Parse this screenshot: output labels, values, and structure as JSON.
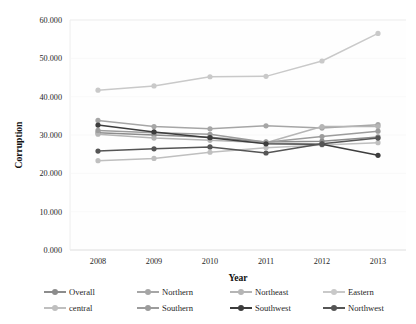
{
  "chart_data": {
    "type": "line",
    "title": "",
    "xlabel": "Year",
    "ylabel": "Corruption",
    "categories": [
      "2008",
      "2009",
      "2010",
      "2011",
      "2012",
      "2013"
    ],
    "x": [
      2008,
      2009,
      2010,
      2011,
      2012,
      2013
    ],
    "ylim": [
      0,
      60
    ],
    "ytick_labels": [
      "0.000",
      "10.000",
      "20.000",
      "30.000",
      "40.000",
      "50.000",
      "60.000"
    ],
    "ytick_values": [
      0,
      10,
      20,
      30,
      40,
      50,
      60
    ],
    "grid": false,
    "legend_position": "bottom",
    "series": [
      {
        "name": "Overall",
        "color": "#8c8c8c",
        "values": [
          30.6,
          30.0,
          29.4,
          28.2,
          28.4,
          29.5
        ]
      },
      {
        "name": "Northern",
        "color": "#a6a6a6",
        "values": [
          33.8,
          32.2,
          31.6,
          32.4,
          31.8,
          32.7
        ]
      },
      {
        "name": "Northeast",
        "color": "#b5b5b5",
        "values": [
          30.2,
          29.2,
          28.6,
          28.0,
          32.2,
          32.2
        ]
      },
      {
        "name": "Eastern",
        "color": "#c9c9c9",
        "values": [
          41.7,
          42.8,
          45.2,
          45.3,
          49.3,
          56.5
        ]
      },
      {
        "name": "central",
        "color": "#bfbfbf",
        "values": [
          23.3,
          23.9,
          25.5,
          26.7,
          27.4,
          28.0
        ]
      },
      {
        "name": "Southern",
        "color": "#9c9c9c",
        "values": [
          31.2,
          30.6,
          30.2,
          28.1,
          29.6,
          31.0
        ]
      },
      {
        "name": "Southwest",
        "color": "#3d3d3d",
        "values": [
          32.6,
          30.8,
          29.3,
          27.7,
          27.6,
          24.7
        ]
      },
      {
        "name": "Northwest",
        "color": "#555555",
        "values": [
          25.8,
          26.4,
          26.9,
          25.3,
          27.7,
          29.2
        ]
      }
    ]
  },
  "axes": {
    "y_title": "Corruption",
    "x_title": "Year"
  },
  "legend": {
    "rows": [
      [
        "Overall",
        "Northern",
        "Northeast",
        "Eastern"
      ],
      [
        "central",
        "Southern",
        "Southwest",
        "Northwest"
      ]
    ]
  }
}
